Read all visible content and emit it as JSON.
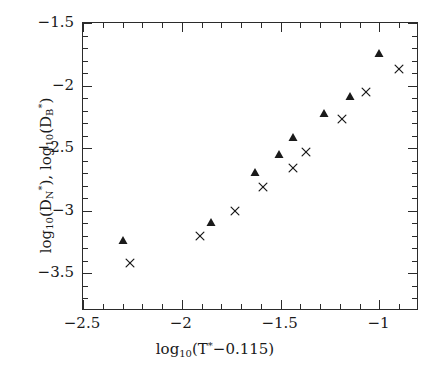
{
  "chart_data": {
    "type": "scatter",
    "title": "",
    "xlabel": "log10(T*-0.115)",
    "ylabel": "log10(D*_N), log10(D*_B)",
    "xlabel_parts": {
      "log": "log",
      "logsub": "10",
      "open": "(T",
      "star": "*",
      "body": "−0.115)"
    },
    "ylabel_parts": {
      "log": "log",
      "logsub": "10",
      "open1": "(D",
      "sub1": "N",
      "star1": "*",
      "mid": "),  log",
      "logsub2": "10",
      "open2": "(D",
      "sub2": "B",
      "star2": "*",
      "close": ")"
    },
    "xlim": [
      -2.5,
      -0.8
    ],
    "ylim": [
      -3.8,
      -1.5
    ],
    "grid": false,
    "legend": "none",
    "xticks_major": [
      -2.5,
      -2.0,
      -1.5,
      -1.0
    ],
    "xticklabels": [
      "−2.5",
      "−2",
      "−1.5",
      "−1"
    ],
    "xticks_minor": [
      -2.4,
      -2.3,
      -2.2,
      -2.1,
      -1.9,
      -1.8,
      -1.7,
      -1.6,
      -1.4,
      -1.3,
      -1.2,
      -1.1,
      -0.9
    ],
    "yticks_major": [
      -1.5,
      -2.0,
      -2.5,
      -3.0,
      -3.5
    ],
    "yticklabels": [
      "−1.5",
      "−2",
      "−2.5",
      "−3",
      "−3.5"
    ],
    "yticks_minor": [
      -1.6,
      -1.7,
      -1.8,
      -1.9,
      -2.1,
      -2.2,
      -2.3,
      -2.4,
      -2.6,
      -2.7,
      -2.8,
      -2.9,
      -3.1,
      -3.2,
      -3.3,
      -3.4,
      -3.6,
      -3.7
    ],
    "series": [
      {
        "name": "log10(D*_N)",
        "marker": "filled-triangle",
        "color": "#1a1a1a",
        "points": [
          [
            -2.3,
            -3.23
          ],
          [
            -1.85,
            -3.09
          ],
          [
            -1.63,
            -2.69
          ],
          [
            -1.51,
            -2.55
          ],
          [
            -1.44,
            -2.41
          ],
          [
            -1.28,
            -2.22
          ],
          [
            -1.15,
            -2.08
          ],
          [
            -1.0,
            -1.74
          ]
        ]
      },
      {
        "name": "log10(D*_B)",
        "marker": "cross",
        "color": "#1a1a1a",
        "points": [
          [
            -2.26,
            -3.42
          ],
          [
            -1.91,
            -3.2
          ],
          [
            -1.73,
            -3.0
          ],
          [
            -1.59,
            -2.81
          ],
          [
            -1.44,
            -2.66
          ],
          [
            -1.37,
            -2.53
          ],
          [
            -1.19,
            -2.27
          ],
          [
            -1.07,
            -2.05
          ],
          [
            -0.9,
            -1.87
          ]
        ]
      }
    ]
  }
}
